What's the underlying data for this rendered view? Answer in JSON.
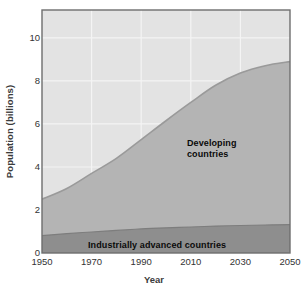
{
  "chart_data": {
    "type": "area",
    "stacked": true,
    "title": "",
    "xlabel": "Year",
    "ylabel": "Population (billions)",
    "xlim": [
      1950,
      2050
    ],
    "ylim": [
      0,
      11.3
    ],
    "xticks": [
      1950,
      1970,
      1990,
      2010,
      2030,
      2050
    ],
    "yticks": [
      0,
      2,
      4,
      6,
      8,
      10
    ],
    "grid": true,
    "legend_position": "inline-annotations",
    "x": [
      1950,
      1960,
      1970,
      1980,
      1990,
      2000,
      2010,
      2020,
      2030,
      2040,
      2050
    ],
    "series": [
      {
        "name": "Industrially advanced countries",
        "color": "#8e8e8e",
        "values": [
          0.81,
          0.9,
          0.98,
          1.05,
          1.12,
          1.17,
          1.21,
          1.25,
          1.28,
          1.3,
          1.32
        ]
      },
      {
        "name": "Developing countries",
        "color": "#b4b4b4",
        "values": [
          1.69,
          2.1,
          2.72,
          3.35,
          4.15,
          4.98,
          5.79,
          6.55,
          7.09,
          7.41,
          7.58
        ]
      }
    ],
    "totals": [
      2.5,
      3.0,
      3.7,
      4.4,
      5.27,
      6.15,
      7.0,
      7.8,
      8.37,
      8.71,
      8.9
    ],
    "annotations": [
      {
        "text": "Developing\ncountries",
        "x": 2012,
        "y": 5.6
      },
      {
        "text": "Industrially advanced countries",
        "x": 1995,
        "y": 0.45
      }
    ],
    "background_color": "#e3e3e3",
    "plot_border_color": "#6e6e6e",
    "gridline_color": "#f2f2f2"
  },
  "axes": {
    "y_title": "Population (billions)",
    "x_title": "Year",
    "y_tick_labels": [
      "10",
      "8",
      "6",
      "4",
      "2",
      "0"
    ],
    "x_tick_labels": [
      "1950",
      "1970",
      "1990",
      "2010",
      "2030",
      "2050"
    ]
  },
  "labels": {
    "developing": "Developing\ncountries",
    "industrial": "Industrially advanced countries"
  }
}
